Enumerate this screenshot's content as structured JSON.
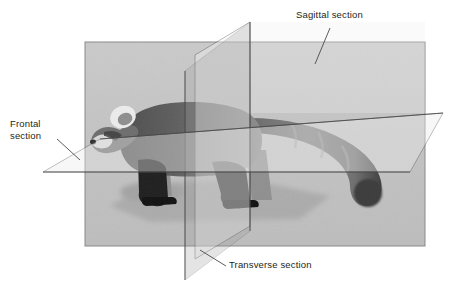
{
  "figure": {
    "background_color": "#ffffff",
    "photo": {
      "name": "red-panda-photo",
      "x": 85,
      "y": 42,
      "width": 340,
      "height": 204,
      "base_color": "#c6c6c6",
      "border_color": "#8a8a8a",
      "description": "grayscale side-view photograph of a red panda walking left"
    },
    "line_color": "#3b3b3b",
    "text_color": "#231f20"
  },
  "labels": {
    "sagittal": "Sagittal section",
    "frontal": "Frontal\nsection",
    "transverse": "Transverse section"
  },
  "planes": [
    {
      "id": "sagittal",
      "label": "Sagittal section",
      "orientation": "vertical-longitudinal",
      "fill": "rgba(245,245,245,0.45)",
      "stroke": "#4a4a4a",
      "points": "195,55 250,22 250,226 195,259"
    },
    {
      "id": "transverse",
      "label": "Transverse section",
      "orientation": "vertical-cross",
      "fill": "rgba(150,150,150,0.30)",
      "stroke": "#4a4a4a",
      "points": "185,71 250,22 250,231 185,280"
    },
    {
      "id": "frontal",
      "label": "Frontal section",
      "orientation": "horizontal",
      "fill": "rgba(235,235,235,0.42)",
      "stroke": "#4a4a4a",
      "points": "43,172 100,139 443,113 410,172"
    }
  ],
  "leaders": [
    {
      "id": "sagittal-leader",
      "from": "330,28",
      "to": "315,64"
    },
    {
      "id": "frontal-leader",
      "from": "57,139",
      "to": "80,160"
    },
    {
      "id": "transverse-leader",
      "from": "226,266",
      "to": "200,250"
    }
  ]
}
